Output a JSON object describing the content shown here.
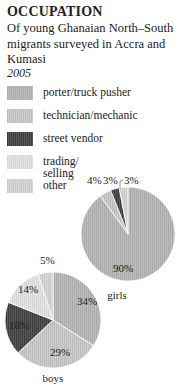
{
  "title": "OCCUPATION",
  "subtitle": "Of young Ghanaian North–South migrants surveyed in Accra and Kumasi",
  "year": "2005",
  "legend": [
    {
      "label": "porter/truck pusher",
      "color": "#b3b3b3"
    },
    {
      "label": "technician/mechanic",
      "color": "#c4c4c4"
    },
    {
      "label": "street vendor",
      "color": "#4a4a4a"
    },
    {
      "label": "trading/\nselling",
      "color": "#dcdcdc"
    },
    {
      "label": "other",
      "color": "#d0d0d0"
    }
  ],
  "chart_data": [
    {
      "type": "pie",
      "title": "girls",
      "categories": [
        "porter/truck pusher",
        "technician/mechanic",
        "street vendor",
        "trading/selling",
        "other"
      ],
      "values": [
        90,
        4,
        3,
        0,
        3
      ],
      "labels": [
        "90%",
        "4%",
        "3%",
        "",
        "3%"
      ]
    },
    {
      "type": "pie",
      "title": "boys",
      "categories": [
        "porter/truck pusher",
        "technician/mechanic",
        "street vendor",
        "trading/selling",
        "other"
      ],
      "values": [
        34,
        29,
        18,
        14,
        5
      ],
      "labels": [
        "34%",
        "29%",
        "18%",
        "14%",
        "5%"
      ]
    }
  ]
}
